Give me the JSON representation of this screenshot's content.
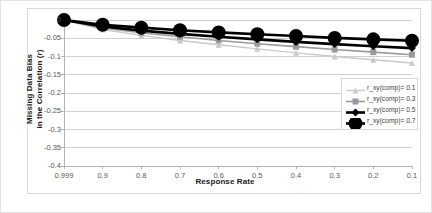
{
  "chart_data": {
    "type": "line",
    "title": "",
    "xlabel": "Response Rate",
    "ylabel": "Missing Data Bias in the Correlation (r)",
    "ylabel_line1": "Missing Data Bias",
    "ylabel_line2": "in the Correlation (",
    "ylabel_italic": "r",
    "ylabel_line2_end": ")",
    "categories": [
      "0.999",
      "0.9",
      "0.8",
      "0.7",
      "0.6",
      "0.5",
      "0.4",
      "0.3",
      "0.2",
      "0.1"
    ],
    "ytick_labels": [
      "0",
      "-0.05",
      "-0.1",
      "-0.15",
      "-0.2",
      "-0.25",
      "-0.3",
      "-0.35",
      "-0.4"
    ],
    "ylim": [
      -0.4,
      0
    ],
    "ytick_step": 0.05,
    "grid": true,
    "grid_axis": "y",
    "legend_position": "right",
    "series": [
      {
        "name": "r_xy(comp)= 0.1",
        "values": [
          0,
          -0.026,
          -0.042,
          -0.056,
          -0.068,
          -0.079,
          -0.09,
          -0.1,
          -0.109,
          -0.118
        ],
        "color": "#c9c9c9",
        "marker": "triangle",
        "marker_size": 3.0,
        "line_width": 1.4
      },
      {
        "name": "r_xy(comp)= 0.3",
        "values": [
          0,
          -0.022,
          -0.035,
          -0.046,
          -0.056,
          -0.065,
          -0.073,
          -0.081,
          -0.088,
          -0.095
        ],
        "color": "#9a9a9a",
        "marker": "square",
        "marker_size": 3.0,
        "line_width": 1.6
      },
      {
        "name": "r_xy(comp)= 0.5",
        "values": [
          0,
          -0.018,
          -0.029,
          -0.038,
          -0.046,
          -0.053,
          -0.06,
          -0.066,
          -0.072,
          -0.077
        ],
        "color": "#000000",
        "marker": "diamond",
        "marker_size": 4.0,
        "line_width": 2.6
      },
      {
        "name": "r_xy(comp)= 0.7",
        "values": [
          0,
          -0.013,
          -0.021,
          -0.028,
          -0.034,
          -0.039,
          -0.044,
          -0.049,
          -0.053,
          -0.057
        ],
        "color": "#000000",
        "marker": "circle",
        "marker_size": 7.0,
        "line_width": 2.6
      }
    ]
  },
  "legend": {
    "items": [
      {
        "label": "r_xy(comp)= 0.1"
      },
      {
        "label": "r_xy(comp)= 0.3"
      },
      {
        "label": "r_xy(comp)= 0.5"
      },
      {
        "label": "r_xy(comp)= 0.7"
      }
    ]
  },
  "colors": {
    "plot_border": "#d8d8d8",
    "gridline": "#d0d0d0",
    "axis_line": "#b3b3b3",
    "tick_text": "#595959",
    "title_text": "#1a1a1a",
    "background": "#ffffff"
  }
}
